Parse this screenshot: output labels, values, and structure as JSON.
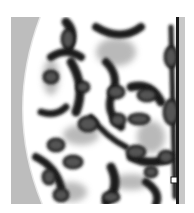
{
  "image": {
    "description": "Grayscale textured image of irregular dark blob shapes with dark outlines on a white background; gray region on the left bounded by a curved arc; dark vertical border on the right with a light gray strip",
    "colors": {
      "background": "#ffffff",
      "left_region": "#bdbdbd",
      "blob_fill": "#555555",
      "blob_outline": "#1a1a1a",
      "mid_gray": "#a8a8a8",
      "right_strip": "#c8c8c8"
    }
  }
}
